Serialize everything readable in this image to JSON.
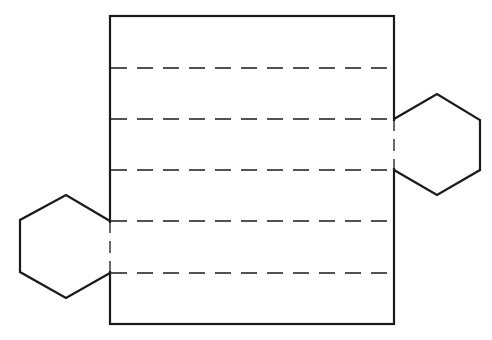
{
  "diagram": {
    "type": "net",
    "stroke_color": "#1a1a1a",
    "background": "#ffffff",
    "rectangle": {
      "x": 110,
      "y": 16,
      "width": 284,
      "height": 308
    },
    "fold_lines_y": [
      68,
      119,
      170,
      221,
      273
    ],
    "hexagons": [
      {
        "id": "right-hexagon",
        "points": [
          [
            394,
            119
          ],
          [
            437,
            94
          ],
          [
            480,
            120
          ],
          [
            480,
            170
          ],
          [
            437,
            195
          ],
          [
            394,
            170
          ]
        ],
        "attached_edge": [
          [
            394,
            119
          ],
          [
            394,
            170
          ]
        ]
      },
      {
        "id": "left-hexagon",
        "points": [
          [
            110,
            221
          ],
          [
            66,
            195
          ],
          [
            20,
            220
          ],
          [
            20,
            272
          ],
          [
            66,
            298
          ],
          [
            110,
            273
          ]
        ],
        "attached_edge": [
          [
            110,
            221
          ],
          [
            110,
            273
          ]
        ]
      }
    ]
  }
}
